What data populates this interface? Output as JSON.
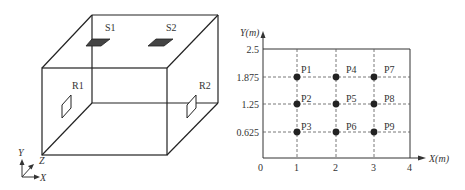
{
  "left_figure": {
    "type": "3d-room-box",
    "sources": [
      {
        "label": "S1"
      },
      {
        "label": "S2"
      }
    ],
    "receivers": [
      {
        "label": "R1"
      },
      {
        "label": "R2"
      }
    ],
    "axes": {
      "x": "X",
      "y": "Y",
      "z": "Z"
    },
    "colors": {
      "line": "#222222",
      "source_fill": "#444444"
    }
  },
  "right_figure": {
    "type": "measurement-point-grid",
    "x_axis_label": "X(m)",
    "y_axis_label": "Y(m)",
    "x_ticks": [
      "0",
      "1",
      "2",
      "3",
      "4"
    ],
    "y_ticks": [
      "2.5",
      "1.875",
      "1.25",
      "0.625"
    ],
    "points": [
      {
        "label": "P1",
        "x": 1,
        "y": 1.875
      },
      {
        "label": "P2",
        "x": 1,
        "y": 1.25
      },
      {
        "label": "P3",
        "x": 1,
        "y": 0.625
      },
      {
        "label": "P4",
        "x": 2,
        "y": 1.875
      },
      {
        "label": "P5",
        "x": 2,
        "y": 1.25
      },
      {
        "label": "P6",
        "x": 2,
        "y": 0.625
      },
      {
        "label": "P7",
        "x": 3,
        "y": 1.875
      },
      {
        "label": "P8",
        "x": 3,
        "y": 1.25
      },
      {
        "label": "P9",
        "x": 3,
        "y": 0.625
      }
    ],
    "colors": {
      "point": "#222222",
      "grid": "#555555"
    }
  }
}
